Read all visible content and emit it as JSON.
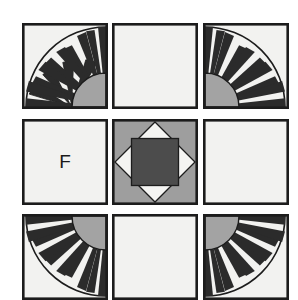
{
  "canvas": {
    "width": 298,
    "height": 297,
    "background": "#ffffff",
    "title": "Quilt block sampler grid"
  },
  "palette": {
    "outline": "#1c1c1c",
    "ray_dark": "#2b2b2b",
    "fabric_white": "#f2f2f0",
    "fabric_light_gray": "#a3a3a3",
    "fabric_medium_gray": "#9e9e9e",
    "fabric_dark_gray": "#4c4c4c",
    "letter_color": "#1a1a1a"
  },
  "grid": {
    "rows": 3,
    "columns": 3,
    "block_size": 86,
    "column_x": [
      22,
      112,
      203
    ],
    "row_y": [
      23,
      119,
      214
    ]
  },
  "blocks": [
    {
      "id": "block-r0c0",
      "row": 0,
      "column": 0,
      "pattern": "mariners-compass-sun",
      "label": "New York Beauty sun block",
      "arc_corner": "bottom-right",
      "ray_count": 9,
      "quarter_circle_radius": 34,
      "arc_radius": 84
    },
    {
      "id": "block-r0c1",
      "row": 0,
      "column": 1,
      "pattern": "plain",
      "label": "Plain background block",
      "fill": "#f2f2f0"
    },
    {
      "id": "block-r0c2",
      "row": 0,
      "column": 2,
      "pattern": "mariners-compass-sun",
      "label": "New York Beauty sun block",
      "arc_corner": "bottom-left",
      "ray_count": 9,
      "quarter_circle_radius": 34,
      "arc_radius": 84
    },
    {
      "id": "block-r1c0",
      "row": 1,
      "column": 0,
      "pattern": "letter",
      "label": "Lettered plain block",
      "letter": "F",
      "fill": "#f2f2f0"
    },
    {
      "id": "block-r1c1",
      "row": 1,
      "column": 1,
      "pattern": "square-in-a-square",
      "label": "Square in a square block",
      "corner_fill": "#9e9e9e",
      "diamond_fill": "#f4f4f2",
      "center_fill": "#4c4c4c"
    },
    {
      "id": "block-r1c2",
      "row": 1,
      "column": 2,
      "pattern": "plain",
      "label": "Plain background block",
      "fill": "#f2f2f0"
    },
    {
      "id": "block-r2c0",
      "row": 2,
      "column": 0,
      "pattern": "mariners-compass-sun",
      "label": "New York Beauty sun block",
      "arc_corner": "top-right",
      "ray_count": 9,
      "quarter_circle_radius": 34,
      "arc_radius": 84
    },
    {
      "id": "block-r2c1",
      "row": 2,
      "column": 1,
      "pattern": "plain",
      "label": "Plain background block",
      "fill": "#f2f2f0"
    },
    {
      "id": "block-r2c2",
      "row": 2,
      "column": 2,
      "pattern": "mariners-compass-sun",
      "label": "New York Beauty sun block",
      "arc_corner": "top-left",
      "ray_count": 9,
      "quarter_circle_radius": 34,
      "arc_radius": 84
    }
  ]
}
